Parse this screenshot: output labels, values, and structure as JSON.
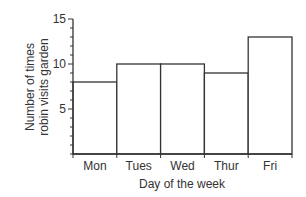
{
  "chart_data": {
    "type": "bar",
    "title": "",
    "categories": [
      "Mon",
      "Tues",
      "Wed",
      "Thur",
      "Fri"
    ],
    "values": [
      8,
      10,
      10,
      9,
      13
    ],
    "xlabel": "Day of the week",
    "ylabel_lines": [
      "Number of times",
      "robin visits garden"
    ],
    "ylabel": "Number of times robin visits garden",
    "ylim": [
      0,
      15
    ],
    "yticks_major": [
      5,
      10,
      15
    ],
    "yticks_minor_step": 1,
    "grid": false,
    "legend": null,
    "bar_fill": "#ffffff",
    "bar_stroke": "#333333"
  }
}
